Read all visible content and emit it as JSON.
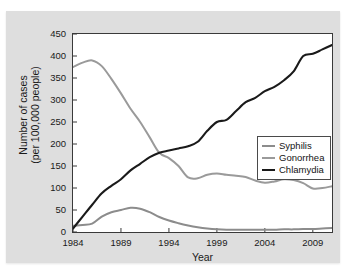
{
  "figure": {
    "cropped_caption_sliver": "",
    "background_color": "#dedede",
    "plot_background": "#ffffff"
  },
  "chart_data": {
    "type": "line",
    "title": "",
    "xlabel": "Year",
    "ylabel_line1": "Number of cases",
    "ylabel_line2": "(per 100,000 people)",
    "xlim": [
      1984,
      2011
    ],
    "ylim": [
      0,
      450
    ],
    "yticks": [
      450,
      400,
      350,
      300,
      250,
      200,
      150,
      100,
      50,
      0
    ],
    "xticks": [
      1984,
      1989,
      1994,
      1999,
      2004,
      2009
    ],
    "grid": false,
    "legend_position": "upper right inside",
    "x": [
      1984,
      1985,
      1986,
      1987,
      1988,
      1989,
      1990,
      1991,
      1992,
      1993,
      1994,
      1995,
      1996,
      1997,
      1998,
      1999,
      2000,
      2001,
      2002,
      2003,
      2004,
      2005,
      2006,
      2007,
      2008,
      2009,
      2010,
      2011
    ],
    "series": [
      {
        "name": "Syphilis",
        "color": "#8c8c8c",
        "values": [
          14,
          16,
          19,
          35,
          45,
          50,
          55,
          53,
          45,
          34,
          26,
          20,
          15,
          11,
          8,
          6,
          5,
          5,
          5,
          5,
          5,
          5,
          6,
          6,
          7,
          7,
          8,
          9
        ]
      },
      {
        "name": "Gonorrhea",
        "color": "#9a9a9a",
        "values": [
          375,
          385,
          390,
          377,
          348,
          315,
          280,
          250,
          215,
          180,
          168,
          150,
          124,
          122,
          130,
          133,
          130,
          128,
          125,
          117,
          112,
          115,
          120,
          118,
          111,
          99,
          100,
          104
        ]
      },
      {
        "name": "Chlamydia",
        "color": "#1a1a1a",
        "values": [
          8,
          35,
          62,
          88,
          105,
          120,
          140,
          155,
          170,
          180,
          185,
          190,
          195,
          205,
          230,
          250,
          255,
          275,
          295,
          305,
          320,
          330,
          345,
          365,
          400,
          405,
          415,
          425
        ]
      }
    ]
  },
  "legend": {
    "items": [
      {
        "label": "Syphilis"
      },
      {
        "label": "Gonorrhea"
      },
      {
        "label": "Chlamydia"
      }
    ]
  }
}
